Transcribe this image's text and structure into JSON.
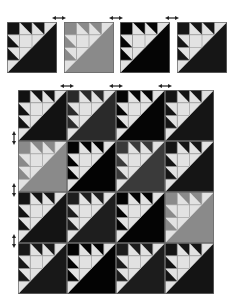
{
  "palette": {
    "light": "#e2e2e2",
    "grid_line": "#9a9a9a",
    "border": "#6a6a6a",
    "arrow": "#222222"
  },
  "top_row": {
    "blocks": [
      {
        "fill": "#141414",
        "x": 7,
        "y": 22,
        "w": 50,
        "h": 51
      },
      {
        "fill": "#8a8a8a",
        "x": 64,
        "y": 22,
        "w": 50,
        "h": 51
      },
      {
        "fill": "#050505",
        "x": 120,
        "y": 22,
        "w": 50,
        "h": 51
      },
      {
        "fill": "#161616",
        "x": 177,
        "y": 22,
        "w": 50,
        "h": 51
      }
    ],
    "arrows": [
      {
        "x": 52,
        "y": 16
      },
      {
        "x": 109,
        "y": 16
      },
      {
        "x": 165,
        "y": 16
      }
    ]
  },
  "quilt": {
    "origin": {
      "x": 18,
      "y": 90
    },
    "cell_w": 49,
    "cell_h": 51,
    "rows": [
      [
        "#121212",
        "#2a2a2a",
        "#050505",
        "#151515"
      ],
      [
        "#8a8a8a",
        "#030303",
        "#3a3a3a",
        "#151515"
      ],
      [
        "#141414",
        "#1e1e1e",
        "#040404",
        "#8a8a8a"
      ],
      [
        "#181818",
        "#030303",
        "#1c1c1c",
        "#141414"
      ]
    ],
    "top_arrows": [
      {
        "x": 60,
        "y": 84
      },
      {
        "x": 109,
        "y": 84
      },
      {
        "x": 158,
        "y": 84
      }
    ],
    "side_arrows": [
      {
        "x": 12,
        "y": 131
      },
      {
        "x": 12,
        "y": 183
      },
      {
        "x": 12,
        "y": 234
      }
    ]
  }
}
